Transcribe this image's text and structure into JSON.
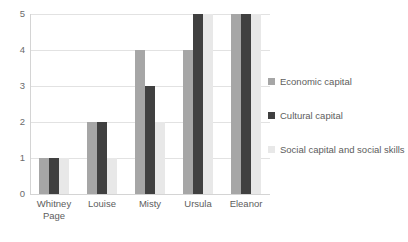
{
  "chart_data": {
    "type": "bar",
    "title": "",
    "subtitle": "",
    "xlabel": "",
    "ylabel": "",
    "ylim": [
      0,
      5
    ],
    "yticks": [
      "0",
      "1",
      "2",
      "3",
      "4",
      "5"
    ],
    "grid": true,
    "legend_position": "right",
    "categories": [
      "Whitney Page",
      "Louise",
      "Misty",
      "Ursula",
      "Eleanor"
    ],
    "category_lines": [
      [
        "Whitney",
        "Page"
      ],
      [
        "Louise"
      ],
      [
        "Misty"
      ],
      [
        "Ursula"
      ],
      [
        "Eleanor"
      ]
    ],
    "series": [
      {
        "name": "Economic capital",
        "color": "#a6a6a6",
        "values": [
          1,
          2,
          4,
          4,
          5
        ]
      },
      {
        "name": "Cultural capital",
        "color": "#404040",
        "values": [
          1,
          2,
          3,
          5,
          5
        ]
      },
      {
        "name": "Social capital and social skills",
        "color": "#e8e8e8",
        "values": [
          1,
          1,
          2,
          5,
          5
        ]
      }
    ]
  },
  "legend": {
    "items": [
      {
        "label": "Economic capital",
        "color": "#a6a6a6"
      },
      {
        "label": "Cultural capital",
        "color": "#404040"
      },
      {
        "label": "Social capital and social skills",
        "color": "#e8e8e8"
      }
    ]
  },
  "axis": {
    "y_tick_labels": [
      "5",
      "4",
      "3",
      "2",
      "1",
      "0"
    ]
  }
}
